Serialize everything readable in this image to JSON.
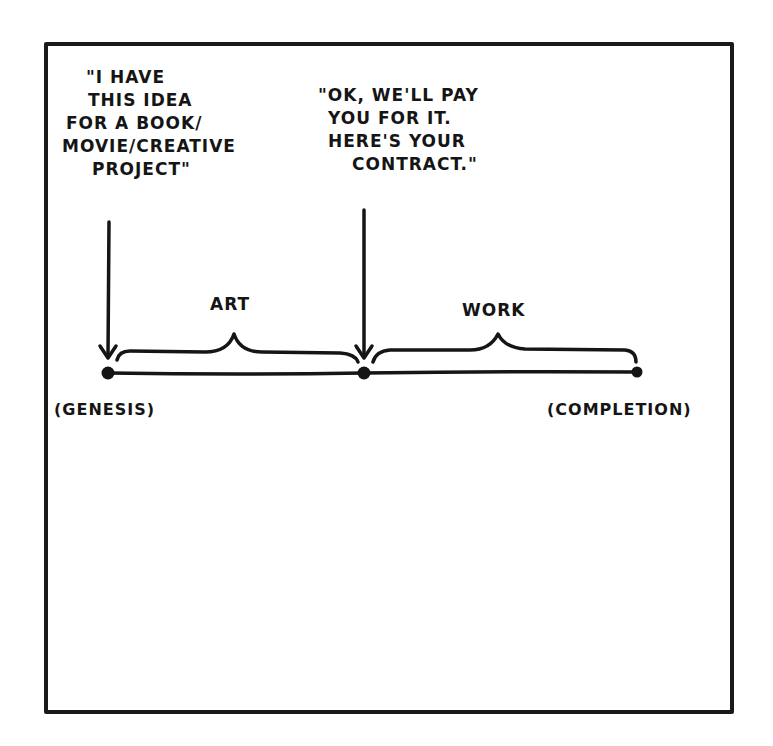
{
  "comic": {
    "quote_idea": {
      "lines": [
        "\"I have",
        "this idea",
        "for a book/",
        "movie/creative",
        "project\""
      ]
    },
    "quote_contract": {
      "lines": [
        "\"OK, we'll pay",
        "you for it.",
        "here's your",
        "contract.\""
      ]
    },
    "brace_labels": {
      "art": "ART",
      "work": "WORK"
    },
    "timeline_points": {
      "start": "(GENESIS)",
      "end": "(COMPLETION)"
    },
    "colors": {
      "ink": "#151515",
      "paper": "#ffffff"
    }
  }
}
